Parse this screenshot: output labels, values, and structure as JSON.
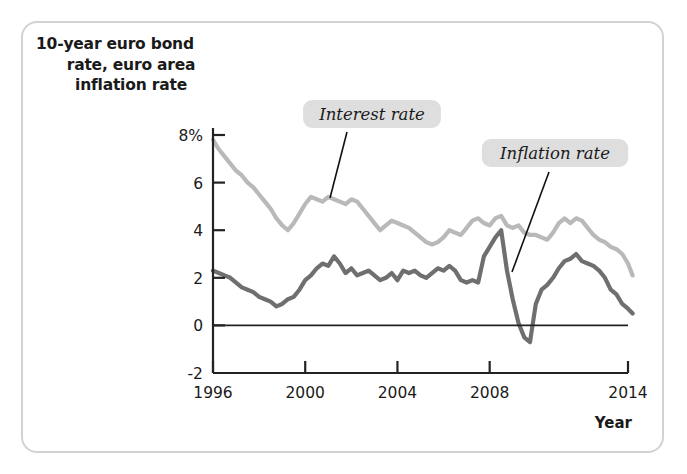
{
  "figure": {
    "title_line1": "10-year euro bond",
    "title_line2": "rate, euro area",
    "title_line3": "inflation rate",
    "x_axis_title": "Year"
  },
  "annotations": {
    "interest": "Interest rate",
    "inflation": "Inflation rate"
  },
  "colors": {
    "interest_rate_line": "#b9b9b9",
    "inflation_rate_line": "#6f6f6f",
    "axis": "#222222",
    "panel_border": "#d2d2d2",
    "annotation_background": "#dedede"
  },
  "chart_data": {
    "type": "line",
    "title": "10-year euro bond rate, euro area inflation rate",
    "xlabel": "Year",
    "ylabel": "10-year euro bond rate, euro area inflation rate",
    "xlim": [
      1996,
      2014
    ],
    "ylim": [
      -2,
      8
    ],
    "xticks": [
      1996,
      2000,
      2004,
      2008,
      2014
    ],
    "xtick_labels": [
      "1996",
      "2000",
      "2004",
      "2008",
      "2014"
    ],
    "yticks": [
      -2,
      0,
      2,
      4,
      6,
      8
    ],
    "ytick_labels": [
      "-2",
      "0",
      "2",
      "4",
      "6",
      "8%"
    ],
    "grid": false,
    "zero_line": true,
    "legend": "annotations with leader lines",
    "series": [
      {
        "name": "Interest rate",
        "color": "#b9b9b9",
        "x": [
          1996.0,
          1996.25,
          1996.5,
          1996.75,
          1997.0,
          1997.25,
          1997.5,
          1997.75,
          1998.0,
          1998.25,
          1998.5,
          1998.75,
          1999.0,
          1999.25,
          1999.5,
          1999.75,
          2000.0,
          2000.25,
          2000.5,
          2000.75,
          2001.0,
          2001.25,
          2001.5,
          2001.75,
          2002.0,
          2002.25,
          2002.5,
          2002.75,
          2003.0,
          2003.25,
          2003.5,
          2003.75,
          2004.0,
          2004.25,
          2004.5,
          2004.75,
          2005.0,
          2005.25,
          2005.5,
          2005.75,
          2006.0,
          2006.25,
          2006.5,
          2006.75,
          2007.0,
          2007.25,
          2007.5,
          2007.75,
          2008.0,
          2008.25,
          2008.5,
          2008.75,
          2009.0,
          2009.25,
          2009.5,
          2009.75,
          2010.0,
          2010.25,
          2010.5,
          2010.75,
          2011.0,
          2011.25,
          2011.5,
          2011.75,
          2012.0,
          2012.25,
          2012.5,
          2012.75,
          2013.0,
          2013.25,
          2013.5,
          2013.75,
          2014.0,
          2014.2
        ],
        "values": [
          7.8,
          7.4,
          7.1,
          6.8,
          6.5,
          6.3,
          6.0,
          5.8,
          5.5,
          5.2,
          4.9,
          4.5,
          4.2,
          4.0,
          4.3,
          4.7,
          5.1,
          5.4,
          5.3,
          5.2,
          5.4,
          5.3,
          5.2,
          5.1,
          5.3,
          5.2,
          4.9,
          4.6,
          4.3,
          4.0,
          4.2,
          4.4,
          4.3,
          4.2,
          4.1,
          3.9,
          3.7,
          3.5,
          3.4,
          3.5,
          3.7,
          4.0,
          3.9,
          3.8,
          4.1,
          4.4,
          4.5,
          4.3,
          4.2,
          4.5,
          4.6,
          4.2,
          4.1,
          4.2,
          3.9,
          3.8,
          3.8,
          3.7,
          3.6,
          3.9,
          4.3,
          4.5,
          4.3,
          4.5,
          4.4,
          4.1,
          3.8,
          3.6,
          3.5,
          3.3,
          3.2,
          3.0,
          2.6,
          2.1
        ]
      },
      {
        "name": "Inflation rate",
        "color": "#6f6f6f",
        "x": [
          1996.0,
          1996.25,
          1996.5,
          1996.75,
          1997.0,
          1997.25,
          1997.5,
          1997.75,
          1998.0,
          1998.25,
          1998.5,
          1998.75,
          1999.0,
          1999.25,
          1999.5,
          1999.75,
          2000.0,
          2000.25,
          2000.5,
          2000.75,
          2001.0,
          2001.25,
          2001.5,
          2001.75,
          2002.0,
          2002.25,
          2002.5,
          2002.75,
          2003.0,
          2003.25,
          2003.5,
          2003.75,
          2004.0,
          2004.25,
          2004.5,
          2004.75,
          2005.0,
          2005.25,
          2005.5,
          2005.75,
          2006.0,
          2006.25,
          2006.5,
          2006.75,
          2007.0,
          2007.25,
          2007.5,
          2007.75,
          2008.0,
          2008.25,
          2008.5,
          2008.75,
          2009.0,
          2009.25,
          2009.5,
          2009.75,
          2010.0,
          2010.25,
          2010.5,
          2010.75,
          2011.0,
          2011.25,
          2011.5,
          2011.75,
          2012.0,
          2012.25,
          2012.5,
          2012.75,
          2013.0,
          2013.25,
          2013.5,
          2013.75,
          2014.0,
          2014.2
        ],
        "values": [
          2.3,
          2.2,
          2.1,
          2.0,
          1.8,
          1.6,
          1.5,
          1.4,
          1.2,
          1.1,
          1.0,
          0.8,
          0.9,
          1.1,
          1.2,
          1.5,
          1.9,
          2.1,
          2.4,
          2.6,
          2.5,
          2.9,
          2.6,
          2.2,
          2.4,
          2.1,
          2.2,
          2.3,
          2.1,
          1.9,
          2.0,
          2.2,
          1.9,
          2.3,
          2.2,
          2.3,
          2.1,
          2.0,
          2.2,
          2.4,
          2.3,
          2.5,
          2.3,
          1.9,
          1.8,
          1.9,
          1.8,
          2.9,
          3.3,
          3.7,
          4.0,
          2.3,
          1.1,
          0.1,
          -0.5,
          -0.7,
          0.9,
          1.5,
          1.7,
          2.0,
          2.4,
          2.7,
          2.8,
          3.0,
          2.7,
          2.6,
          2.5,
          2.3,
          2.0,
          1.5,
          1.3,
          0.9,
          0.7,
          0.5
        ]
      }
    ]
  }
}
